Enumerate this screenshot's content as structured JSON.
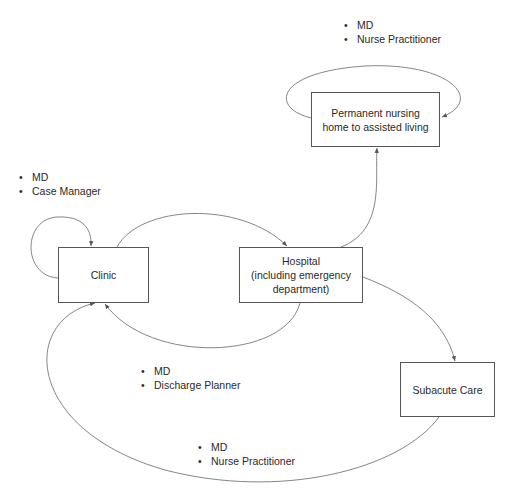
{
  "diagram": {
    "nodes": {
      "nursing_home": {
        "lines": [
          "Permanent nursing",
          "home to assisted living"
        ]
      },
      "clinic": {
        "lines": [
          "Clinic"
        ]
      },
      "hospital": {
        "lines": [
          "Hospital",
          "(including emergency",
          "department)"
        ]
      },
      "subacute": {
        "lines": [
          "Subacute Care"
        ]
      }
    },
    "labels": {
      "nursing_home_staff": [
        "MD",
        "Nurse Practitioner"
      ],
      "clinic_staff": [
        "MD",
        "Case Manager"
      ],
      "hospital_discharge_staff": [
        "MD",
        "Discharge Planner"
      ],
      "subacute_staff": [
        "MD",
        "Nurse Practitioner"
      ]
    },
    "edges": [
      {
        "from": "nursing_home",
        "to": "nursing_home",
        "type": "self-loop"
      },
      {
        "from": "clinic",
        "to": "clinic",
        "type": "self-loop"
      },
      {
        "from": "clinic",
        "to": "hospital"
      },
      {
        "from": "hospital",
        "to": "clinic"
      },
      {
        "from": "hospital",
        "to": "nursing_home"
      },
      {
        "from": "hospital",
        "to": "subacute"
      },
      {
        "from": "subacute",
        "to": "clinic"
      }
    ],
    "line_color": "#555555"
  }
}
